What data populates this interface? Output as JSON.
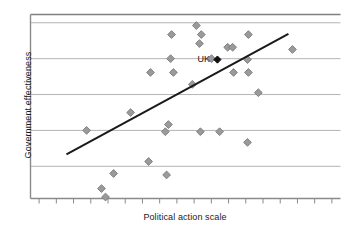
{
  "chart_data": {
    "type": "scatter",
    "title": "",
    "xlabel": "Political action scale",
    "ylabel": "Government effectiveness",
    "xlim": [
      0,
      100
    ],
    "ylim": [
      0,
      100
    ],
    "grid": true,
    "gridlines_y": [
      17.5,
      37,
      56.5,
      76,
      95.5
    ],
    "legend": false,
    "xticks_count": 18,
    "xtick_labels": [],
    "ytick_labels": [],
    "annotations": [
      {
        "text": "UK",
        "x": 60.3,
        "y": 75.5,
        "marker": "black-diamond"
      }
    ],
    "series": [
      {
        "name": "Countries",
        "marker": "diamond",
        "color": "#9a9a9a",
        "points": [
          {
            "x": 18.1,
            "y": 37.0
          },
          {
            "x": 26.8,
            "y": 13.6
          },
          {
            "x": 22.9,
            "y": 5.4
          },
          {
            "x": 24.2,
            "y": 0.8
          },
          {
            "x": 32.3,
            "y": 46.7
          },
          {
            "x": 38.1,
            "y": 20.1
          },
          {
            "x": 43.5,
            "y": 36.3
          },
          {
            "x": 44.5,
            "y": 40.2
          },
          {
            "x": 43.9,
            "y": 12.8
          },
          {
            "x": 38.7,
            "y": 68.5
          },
          {
            "x": 46.1,
            "y": 68.5
          },
          {
            "x": 45.5,
            "y": 89.1
          },
          {
            "x": 45.2,
            "y": 76.0
          },
          {
            "x": 52.2,
            "y": 62.0
          },
          {
            "x": 54.5,
            "y": 84.2
          },
          {
            "x": 53.5,
            "y": 94.0
          },
          {
            "x": 55.1,
            "y": 89.1
          },
          {
            "x": 54.8,
            "y": 36.3
          },
          {
            "x": 61.0,
            "y": 36.3
          },
          {
            "x": 58.4,
            "y": 76.0
          },
          {
            "x": 63.6,
            "y": 82.2
          },
          {
            "x": 65.2,
            "y": 82.2
          },
          {
            "x": 65.5,
            "y": 68.5
          },
          {
            "x": 70.3,
            "y": 89.1
          },
          {
            "x": 70.0,
            "y": 75.5
          },
          {
            "x": 70.3,
            "y": 68.5
          },
          {
            "x": 70.0,
            "y": 30.5
          },
          {
            "x": 73.5,
            "y": 57.5
          },
          {
            "x": 84.5,
            "y": 81.0
          }
        ]
      }
    ],
    "trendline": {
      "name": "linear fit",
      "color": "#1a1a1a",
      "x0": 11.6,
      "y0": 24.0,
      "x1": 83.2,
      "y1": 89.5
    }
  },
  "colors": {
    "marker_fill": "#9a9a9a",
    "marker_edge": "#7a7a7a",
    "uk_marker": "#111111",
    "gridline": "#b5b5b5",
    "frame": "#808080",
    "axis": "#8a8a8a",
    "trendline": "#1a1a1a",
    "text": "#1a1a1a",
    "background": "#ffffff"
  }
}
